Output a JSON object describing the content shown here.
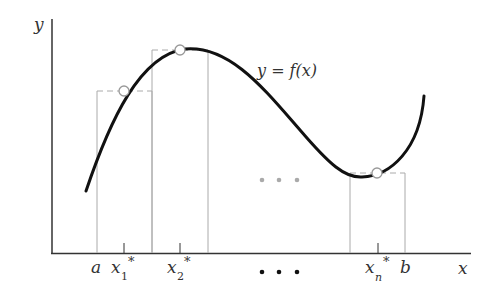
{
  "diagram": {
    "axes": {
      "x_label": "x",
      "y_label": "y"
    },
    "curve_label": "y = f(x)",
    "interval": {
      "left": "a",
      "right": "b"
    },
    "sample_points": [
      {
        "name": "x",
        "sub": "1",
        "sup": "*"
      },
      {
        "name": "x",
        "sub": "2",
        "sup": "*"
      },
      {
        "name": "x",
        "sub": "n",
        "sup": "*"
      }
    ],
    "ellipsis": "• • •",
    "colors": {
      "curve": "#111111",
      "rectangles": "#aaaaaa",
      "axes": "#333333",
      "sample_marker_fill": "#ffffff",
      "sample_marker_stroke": "#999999",
      "ellipsis_mid": "#aaaaaa",
      "ellipsis_axis": "#111111"
    }
  }
}
